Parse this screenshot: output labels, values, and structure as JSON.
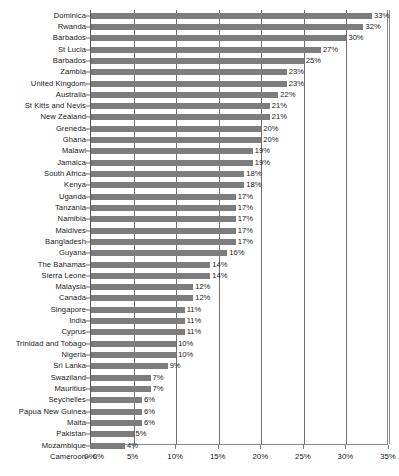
{
  "chart_data": {
    "type": "bar",
    "orientation": "horizontal",
    "title": "",
    "subtitle": "",
    "xlabel": "",
    "ylabel": "",
    "xlim": [
      0,
      35
    ],
    "xtick_labels": [
      "0%",
      "5%",
      "10%",
      "15%",
      "20%",
      "25%",
      "30%",
      "35%"
    ],
    "xtick_values": [
      0,
      5,
      10,
      15,
      20,
      25,
      30,
      35
    ],
    "grid": true,
    "legend": false,
    "value_label_suffix": "%",
    "bar_color": "#7d7d7d",
    "categories": [
      "Dominica",
      "Rwanda",
      "Barbados",
      "St Lucia",
      "Barbados",
      "Zambia",
      "United Kingdom",
      "Australia",
      "St Kitts and Nevis",
      "New Zealand",
      "Greneda",
      "Ghana",
      "Malawi",
      "Jamaica",
      "South Africa",
      "Kenya",
      "Uganda",
      "Tanzania",
      "Namibia",
      "Maldives",
      "Bangladesh",
      "Guyana",
      "The Bahamas",
      "Sierra Leone",
      "Malaysia",
      "Canada",
      "Singapore",
      "India",
      "Cyprus",
      "Trinidad and Tobago",
      "Nigeria",
      "Sri Lanka",
      "Swaziland",
      "Mauritius",
      "Seychelles",
      "Papua New Guinea",
      "Malta",
      "Pakistan",
      "Mozambique",
      "Cameroon"
    ],
    "values": [
      33,
      32,
      30,
      27,
      25,
      23,
      23,
      22,
      21,
      21,
      20,
      20,
      19,
      19,
      18,
      18,
      17,
      17,
      17,
      17,
      17,
      16,
      14,
      14,
      12,
      12,
      11,
      11,
      11,
      10,
      10,
      9,
      7,
      7,
      6,
      6,
      6,
      5,
      4,
      0
    ],
    "value_labels": [
      "33%",
      "32%",
      "30%",
      "27%",
      "25%",
      "23%",
      "23%",
      "22%",
      "21%",
      "21%",
      "20%",
      "20%",
      "19%",
      "19%",
      "18%",
      "18%",
      "17%",
      "17%",
      "17%",
      "17%",
      "17%",
      "16%",
      "14%",
      "14%",
      "12%",
      "12%",
      "11%",
      "11%",
      "11%",
      "10%",
      "10%",
      "9%",
      "7%",
      "7%",
      "6%",
      "6%",
      "6%",
      "5%",
      "4%",
      "0%"
    ]
  }
}
